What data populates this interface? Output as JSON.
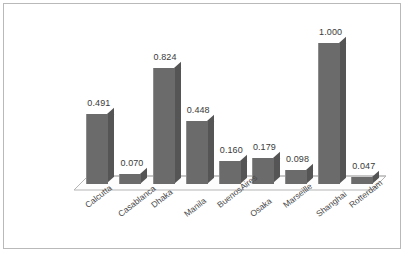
{
  "chart_data": {
    "type": "bar",
    "title": "",
    "subtitle": "",
    "xlabel": "",
    "ylabel": "",
    "ylim": [
      0,
      1.0
    ],
    "grid": false,
    "legend": "none",
    "style": "3d-column",
    "categories": [
      "Calcutta",
      "Casablanca",
      "Dhaka",
      "Manila",
      "BuenosAires",
      "Osaka",
      "Marseille",
      "Shanghai",
      "Rotterdam"
    ],
    "values": [
      0.491,
      0.07,
      0.824,
      0.448,
      0.16,
      0.179,
      0.098,
      1.0,
      0.047
    ],
    "value_labels": [
      "0.491",
      "0.070",
      "0.824",
      "0.448",
      "0.160",
      "0.179",
      "0.098",
      "1.000",
      "0.047"
    ],
    "colors": {
      "bar_front": "#6b6b6b",
      "bar_side": "#555555",
      "bar_top": "#8a8a8a",
      "frame": "#b9b9b9",
      "floor_line": "#b5b5b5",
      "label_text": "#3a3a3a",
      "background": "#ffffff"
    }
  }
}
